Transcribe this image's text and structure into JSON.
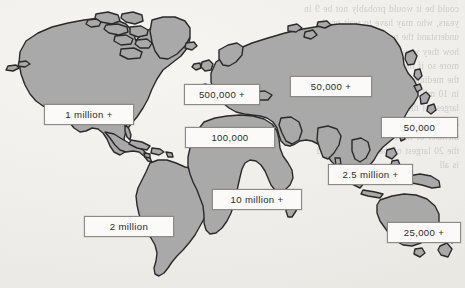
{
  "page": {
    "width": 465,
    "height": 288,
    "background_color": "#efeeea",
    "land_fill_color": "#a9a9a9",
    "land_stroke_color": "#2a2a2a",
    "label_fill_color": "#fbfaf8",
    "label_border_color": "#8c8a86",
    "label_text_color": "#2b2a28"
  },
  "map": {
    "name": "world-population-map",
    "type": "world-outline-map",
    "description": "Greyscale world outline map with boxed population callout labels"
  },
  "bleedthrough": {
    "note": "faint mirrored text showing through from the reverse side of the scanned page",
    "lines": [
      "could be it would probably not be 9 in",
      "years, who may have to wait on the",
      "understand the need for patience and",
      "how they would not the larger this",
      "more so if the population is the 20th",
      "the medium and the number of the",
      "in 10 million people would be the 20",
      "largest of the population. Two-thirds",
      "and 40% by 2025 in some or has more",
      "member of the factory workers,  has",
      "the 20 largest of the population and",
      "is all"
    ]
  },
  "callouts": [
    {
      "id": "north-america",
      "label": "1 million +",
      "x": 44,
      "y": 104,
      "w": 90,
      "h": 21
    },
    {
      "id": "south-america",
      "label": "2 million",
      "x": 84,
      "y": 216,
      "w": 90,
      "h": 21
    },
    {
      "id": "europe",
      "label": "500,000 +",
      "x": 184,
      "y": 84,
      "w": 76,
      "h": 21
    },
    {
      "id": "mediterranean",
      "label": "100,000",
      "x": 185,
      "y": 127,
      "w": 90,
      "h": 21
    },
    {
      "id": "russia-north-asia",
      "label": "50,000 +",
      "x": 290,
      "y": 76,
      "w": 82,
      "h": 21
    },
    {
      "id": "east-asia",
      "label": "50,000",
      "x": 381,
      "y": 117,
      "w": 77,
      "h": 21
    },
    {
      "id": "south-east-asia",
      "label": "2.5 million +",
      "x": 328,
      "y": 164,
      "w": 85,
      "h": 21
    },
    {
      "id": "africa",
      "label": "10 million +",
      "x": 212,
      "y": 189,
      "w": 90,
      "h": 21
    },
    {
      "id": "oceania",
      "label": "25,000 +",
      "x": 387,
      "y": 222,
      "w": 74,
      "h": 21
    }
  ]
}
